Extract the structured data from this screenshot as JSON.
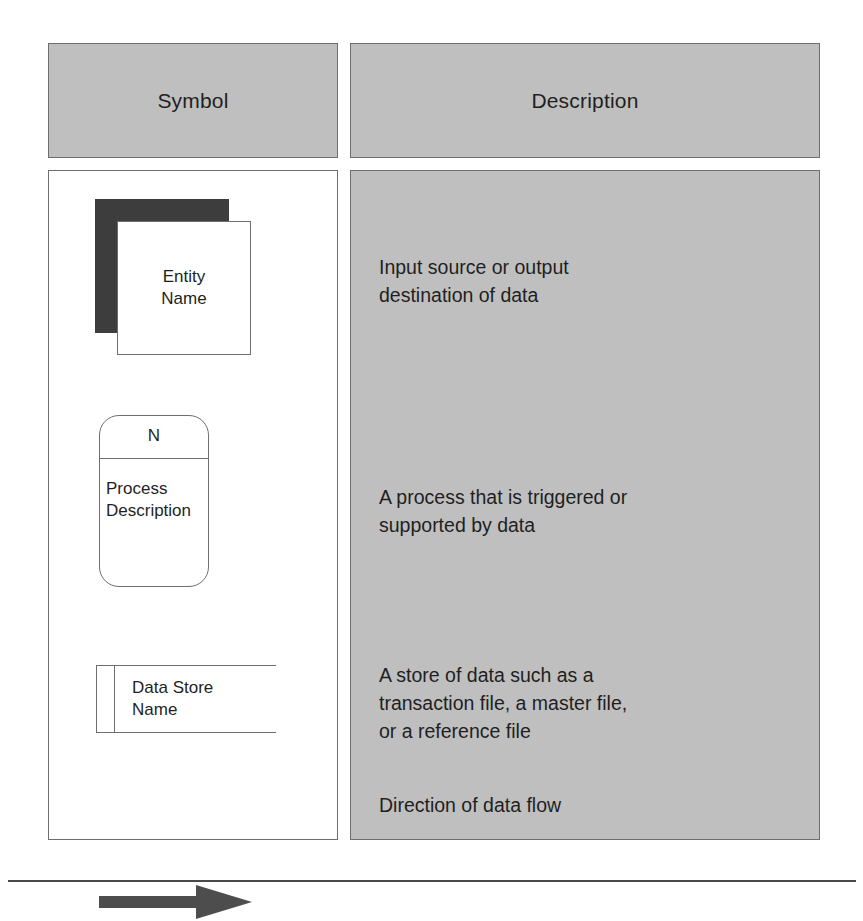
{
  "table": {
    "headers": {
      "symbol": "Symbol",
      "description": "Description"
    },
    "rows": [
      {
        "symbol_type": "external-entity",
        "symbol_label": "Entity\nName",
        "description": "Input source or output\ndestination of data"
      },
      {
        "symbol_type": "process",
        "symbol_number": "N",
        "symbol_label": "Process\nDescription",
        "description": "A process that is triggered or\nsupported by data"
      },
      {
        "symbol_type": "data-store",
        "symbol_label": "Data Store\nName",
        "description": "A store of data such as a\ntransaction file, a master file,\nor a reference file"
      },
      {
        "symbol_type": "data-flow-arrow",
        "symbol_label": "",
        "description": "Direction of data flow"
      }
    ]
  },
  "colors": {
    "header_fill": "#bfbfbf",
    "description_fill": "#bfbfbf",
    "symbol_cell_fill": "#ffffff",
    "border": "#6e6e6e",
    "entity_shadow": "#3d3d3d",
    "arrow_fill": "#4d4d4d",
    "text": "#1f1f1f",
    "rule": "#4a4a4a"
  }
}
